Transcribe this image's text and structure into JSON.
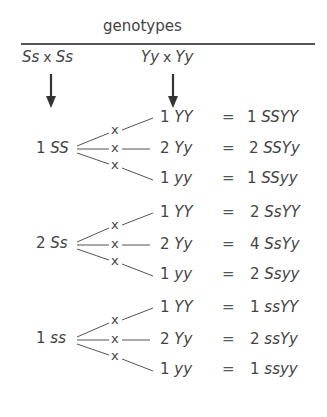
{
  "header": {
    "title": "genotypes"
  },
  "parents": {
    "seed_cross": "Ss × Ss",
    "color_cross": "Yy × Yy",
    "seed_left": "Ss",
    "seed_right": "Ss",
    "color_left": "Yy",
    "color_right": "Yy",
    "cross_symbol": "x"
  },
  "groups": [
    {
      "count": "1",
      "genotype": "SS",
      "rows": [
        {
          "count": "1",
          "genotype": "YY",
          "result_count": "1",
          "result_genotype": "SSYY"
        },
        {
          "count": "2",
          "genotype": "Yy",
          "result_count": "2",
          "result_genotype": "SSYy"
        },
        {
          "count": "1",
          "genotype": "yy",
          "result_count": "1",
          "result_genotype": "SSyy"
        }
      ]
    },
    {
      "count": "2",
      "genotype": "Ss",
      "rows": [
        {
          "count": "1",
          "genotype": "YY",
          "result_count": "2",
          "result_genotype": "SsYY"
        },
        {
          "count": "2",
          "genotype": "Yy",
          "result_count": "4",
          "result_genotype": "SsYy"
        },
        {
          "count": "1",
          "genotype": "yy",
          "result_count": "2",
          "result_genotype": "Ssyy"
        }
      ]
    },
    {
      "count": "1",
      "genotype": "ss",
      "rows": [
        {
          "count": "1",
          "genotype": "YY",
          "result_count": "1",
          "result_genotype": "ssYY"
        },
        {
          "count": "2",
          "genotype": "Yy",
          "result_count": "2",
          "result_genotype": "ssYy"
        },
        {
          "count": "1",
          "genotype": "yy",
          "result_count": "1",
          "result_genotype": "ssyy"
        }
      ]
    }
  ],
  "symbols": {
    "equals": "=",
    "cross": "x"
  },
  "colors": {
    "ink": "#444444",
    "background": "#ffffff"
  }
}
